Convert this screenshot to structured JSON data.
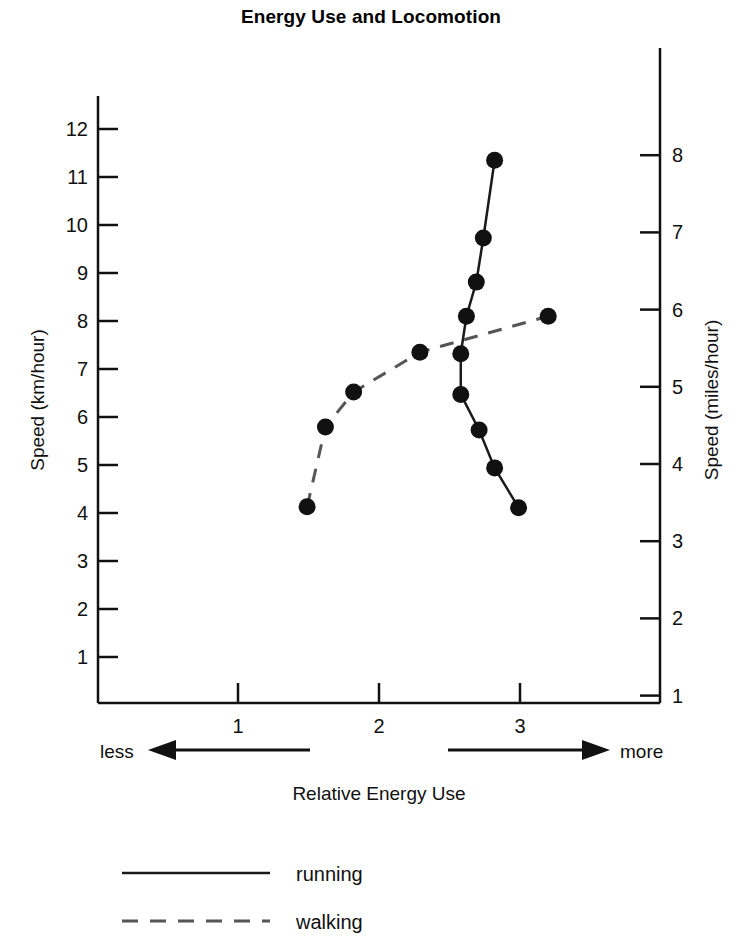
{
  "chart_data": {
    "type": "line",
    "title": "Energy Use and Locomotion",
    "xlabel": "Relative Energy Use",
    "ylabel": "Speed (km/hour)",
    "y2label": "Speed (miles/hour)",
    "xlim": [
      0.0,
      3.99
    ],
    "ylim": [
      0.0,
      12.96
    ],
    "y2lim": [
      0.0,
      8.06
    ],
    "grid": false,
    "legend_position": "bottom",
    "x_ticks": [
      1,
      2,
      3
    ],
    "x_tick_labels": [
      "1",
      "2",
      "3"
    ],
    "y_ticks": [
      1,
      2,
      3,
      4,
      5,
      6,
      7,
      8,
      9,
      10,
      11,
      12
    ],
    "y_tick_labels": [
      "1",
      "2",
      "3",
      "4",
      "5",
      "6",
      "7",
      "8",
      "9",
      "10",
      "11",
      "12"
    ],
    "y2_ticks": [
      1,
      2,
      3,
      4,
      5,
      6,
      7,
      8
    ],
    "y2_tick_labels": [
      "1",
      "2",
      "3",
      "4",
      "5",
      "6",
      "7",
      "8"
    ],
    "annotations": {
      "left_arrow_label": "less",
      "right_arrow_label": "more"
    },
    "series": [
      {
        "name": "running",
        "line_style": "solid",
        "color": "#1a1a1a",
        "marker": "filled-circle",
        "points": [
          {
            "x": 2.99,
            "y": 4.11
          },
          {
            "x": 2.82,
            "y": 4.94
          },
          {
            "x": 2.71,
            "y": 5.73
          },
          {
            "x": 2.58,
            "y": 6.47
          },
          {
            "x": 2.58,
            "y": 7.32
          },
          {
            "x": 2.62,
            "y": 8.1
          },
          {
            "x": 2.69,
            "y": 8.81
          },
          {
            "x": 2.74,
            "y": 9.73
          },
          {
            "x": 2.82,
            "y": 11.35
          }
        ]
      },
      {
        "name": "walking",
        "line_style": "dashed",
        "color": "#555555",
        "marker": "filled-circle",
        "points": [
          {
            "x": 1.49,
            "y": 4.13
          },
          {
            "x": 1.62,
            "y": 5.79
          },
          {
            "x": 1.82,
            "y": 6.52
          },
          {
            "x": 2.29,
            "y": 7.35
          },
          {
            "x": 3.2,
            "y": 8.1
          }
        ]
      }
    ]
  },
  "legend": {
    "items": [
      {
        "label": "running",
        "style": "solid"
      },
      {
        "label": "walking",
        "style": "dashed"
      }
    ]
  }
}
